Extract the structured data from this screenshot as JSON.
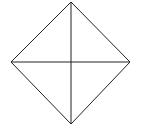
{
  "diagram": {
    "type": "rhombus-with-diagonals",
    "background": "#ffffff",
    "stroke_color": "#222222",
    "stroke_width": 1,
    "vertices": {
      "top": [
        71,
        2
      ],
      "right": [
        130,
        62
      ],
      "bottom": [
        71,
        124
      ],
      "left": [
        11,
        62
      ]
    },
    "center": [
      71,
      62
    ],
    "labels": []
  }
}
